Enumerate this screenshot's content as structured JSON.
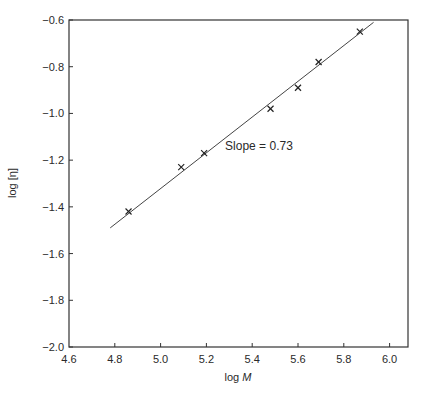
{
  "chart_data": {
    "type": "scatter",
    "title": "",
    "xlabel": "log M",
    "xlabel_parts": {
      "prefix": "log ",
      "italic": "M"
    },
    "ylabel": "log [η]",
    "xlim": [
      4.6,
      6.0
    ],
    "ylim": [
      -2.0,
      -0.6
    ],
    "xticks": [
      4.6,
      4.8,
      5.0,
      5.2,
      5.4,
      5.6,
      5.8,
      6.0
    ],
    "xtick_labels": [
      "4.6",
      "4.8",
      "5.0",
      "5.2",
      "5.4",
      "5.6",
      "5.8",
      "6.0"
    ],
    "yticks": [
      -0.6,
      -0.8,
      -1.0,
      -1.2,
      -1.4,
      -1.6,
      -1.8,
      -2.0
    ],
    "ytick_labels": [
      "−0.6",
      "−0.8",
      "−1.0",
      "−1.2",
      "−1.4",
      "−1.6",
      "−1.8",
      "−2.0"
    ],
    "grid": false,
    "series": [
      {
        "name": "data",
        "marker": "x",
        "x": [
          4.86,
          5.09,
          5.19,
          5.48,
          5.6,
          5.69,
          5.87
        ],
        "y": [
          -1.42,
          -1.23,
          -1.17,
          -0.98,
          -0.89,
          -0.78,
          -0.65
        ]
      }
    ],
    "fit_line": {
      "x": [
        4.78,
        5.93
      ],
      "y": [
        -1.49,
        -0.61
      ],
      "slope": 0.73
    },
    "annotations": [
      {
        "text": "Slope = 0.73",
        "x": 5.5,
        "y": -1.14
      }
    ]
  }
}
